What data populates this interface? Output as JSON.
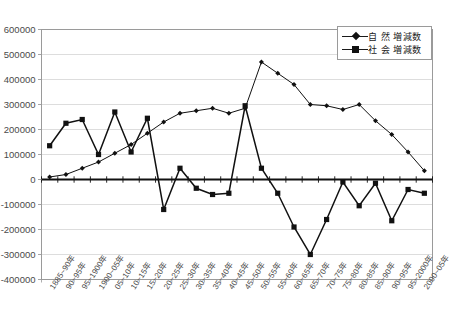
{
  "chart_data": {
    "type": "line",
    "title": "",
    "xlabel": "",
    "ylabel": "",
    "ylim": [
      -400000,
      600000
    ],
    "ytick_step": 100000,
    "grid": true,
    "legend_position": "top-right",
    "yticks": [
      "600000",
      "500000",
      "400000",
      "300000",
      "200000",
      "100000",
      "0",
      "-100000",
      "-200000",
      "-300000",
      "-400000"
    ],
    "categories": [
      "1885~90年",
      "90~95年",
      "95~1900年",
      "1900~05年",
      "05~10年",
      "10~15年",
      "15~20年",
      "20~25年",
      "25~30年",
      "30~35年",
      "35~40年",
      "40~45年",
      "45~50年",
      "50~55年",
      "55~60年",
      "60~65年",
      "65~70年",
      "70~75年",
      "75~80年",
      "80~85年",
      "85~90年",
      "90~95年",
      "95~2000年",
      "2000~05年"
    ],
    "series": [
      {
        "name": "自 然  増減数",
        "marker": "diamond",
        "color": "#111111",
        "values": [
          10000,
          20000,
          45000,
          70000,
          105000,
          140000,
          185000,
          230000,
          265000,
          275000,
          285000,
          265000,
          285000,
          470000,
          425000,
          380000,
          300000,
          295000,
          280000,
          300000,
          235000,
          180000,
          110000,
          35000
        ]
      },
      {
        "name": "社 会  増減数",
        "marker": "square",
        "color": "#111111",
        "values": [
          135000,
          225000,
          240000,
          100000,
          270000,
          110000,
          245000,
          -120000,
          45000,
          -35000,
          -60000,
          -55000,
          295000,
          45000,
          -55000,
          -190000,
          -300000,
          -160000,
          -10000,
          -105000,
          -15000,
          -165000,
          -40000,
          -55000
        ]
      }
    ]
  },
  "legend": {
    "items": [
      {
        "label": "自 然  増減数",
        "marker": "diamond"
      },
      {
        "label": "社 会  増減数",
        "marker": "square"
      }
    ]
  }
}
